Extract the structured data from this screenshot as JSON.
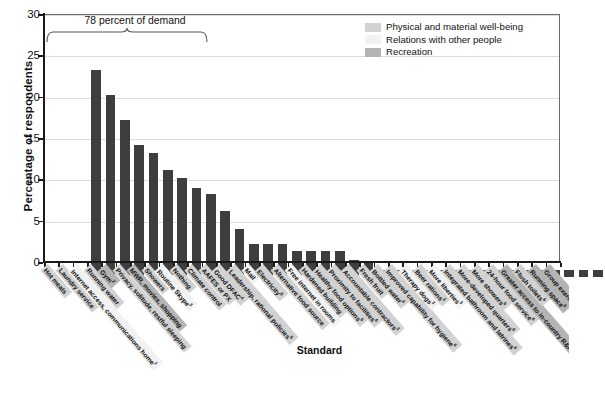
{
  "chart_data": {
    "type": "bar",
    "title": "",
    "xlabel": "Standard",
    "ylabel": "Percentage of respondents",
    "ylim": [
      0,
      30
    ],
    "yticks": [
      0,
      5,
      10,
      15,
      20,
      25,
      30
    ],
    "grid": true,
    "annotation": "78 percent of demand",
    "legend_position": "top-right",
    "legend": [
      {
        "label": "Physical and material well-being",
        "color": "#d2d2d2"
      },
      {
        "label": "Relations with other people",
        "color": "#f2f2f2"
      },
      {
        "label": "Recreation",
        "color": "#b4b4b4"
      }
    ],
    "bar_color": "#3e3e3e",
    "categories": [
      "Hot meals",
      "Laundry service",
      "Internet access, communications home",
      "Running water",
      "Gym",
      "Privacy, solitude, restful sleeping",
      "MWR, movies, shopping",
      "Showers",
      "Routine Skype",
      "Nothing",
      "Climate control",
      "AAFES or PX",
      "Good DFAC",
      "Leadership, rational policies",
      "Mail",
      "Electricity",
      "Alternative food source",
      "Free internet in rooms",
      "Hardened building",
      "Healthy food options",
      "Proximity to facilities",
      "Accountable contractors",
      "Fresh fruit",
      "Bottled water",
      "Improved capability for hygiene",
      "Therapy dogs",
      "Beer rations",
      "More liberties",
      "Integrated bathroom and latrines",
      "More-developed quarters",
      "More showers",
      "24-hour food service",
      "Greater access to in-country R&R",
      "Flush toilets",
      "Running space",
      "Group exercise options"
    ],
    "category_notes": [
      "",
      "",
      "1",
      "",
      "2",
      "",
      "",
      "",
      "3",
      "",
      "",
      "",
      "4",
      "5",
      "",
      "6",
      "",
      "",
      "",
      "6",
      "6",
      "3",
      "",
      "4",
      "6",
      "3",
      "3",
      "3",
      "6",
      "6",
      "6",
      "6",
      "3",
      "6",
      "6",
      "4"
    ],
    "category_groups": [
      0,
      0,
      1,
      0,
      2,
      0,
      2,
      0,
      1,
      0,
      0,
      0,
      0,
      0,
      1,
      0,
      0,
      1,
      0,
      0,
      0,
      0,
      0,
      0,
      0,
      1,
      0,
      1,
      0,
      0,
      0,
      0,
      2,
      0,
      2,
      2
    ],
    "values": [
      25,
      22,
      19,
      16,
      15,
      13,
      12,
      10.8,
      10,
      8,
      5.8,
      4,
      4,
      4,
      3.2,
      3.2,
      3.2,
      3.2,
      2,
      1.8,
      0.8,
      0.8,
      0.8,
      0.8,
      0.8,
      0.8,
      0.8,
      0.8,
      0.8,
      0.8,
      0.8,
      0.8,
      0.8,
      0.8,
      0.8,
      0.8
    ]
  },
  "axis": {
    "y_title": "Percentage of respondents",
    "x_title": "Standard"
  },
  "annotation": {
    "brace_text": "78 percent of demand"
  }
}
